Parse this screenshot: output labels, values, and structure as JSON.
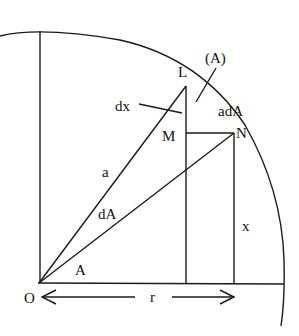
{
  "diagram": {
    "colors": {
      "stroke": "#1a1a1a",
      "text": "#111111",
      "background": "#ffffff"
    },
    "labels": {
      "L": "L",
      "A_paren": "(A)",
      "dx": "dx",
      "adA": "adA",
      "M": "M",
      "N": "N",
      "a": "a",
      "dA": "dA",
      "x": "x",
      "A": "A",
      "O": "O",
      "r": "r"
    }
  }
}
